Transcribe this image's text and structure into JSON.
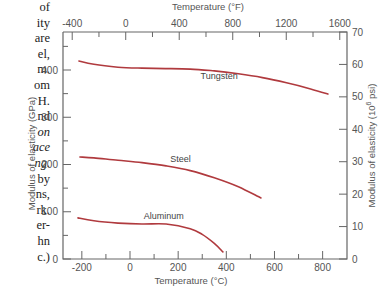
{
  "caption_fragments": [
    {
      "text": "of",
      "italic": false
    },
    {
      "text": "ity",
      "italic": false
    },
    {
      "text": "are",
      "italic": false
    },
    {
      "text": "el,",
      "italic": false
    },
    {
      "text": "m.",
      "italic": false
    },
    {
      "text": "om",
      "italic": false
    },
    {
      "text": "H.",
      "italic": false
    },
    {
      "text": "nd",
      "italic": false
    },
    {
      "text": "on",
      "italic": true
    },
    {
      "text": "ace",
      "italic": true
    },
    {
      "text": "ng.",
      "italic": true
    },
    {
      "text": "by",
      "italic": false
    },
    {
      "text": "ns,",
      "italic": false
    },
    {
      "text": "rk.",
      "italic": false
    },
    {
      "text": "er-",
      "italic": false
    },
    {
      "text": "hn",
      "italic": false
    },
    {
      "text": "c.)",
      "italic": false
    }
  ],
  "chart_data": {
    "type": "line",
    "title": "",
    "xlabel": "Temperature (°C)",
    "ylabel": "Modulus of elasticity (GPa)",
    "x2label": "Temperature (°F)",
    "y2label": "Modulus of elasticity (10^6 psi)",
    "xlim": [
      -270,
      910
    ],
    "ylim": [
      0,
      480
    ],
    "y2lim": [
      0,
      70
    ],
    "grid": false,
    "legend": "inline labels",
    "x_ticks": [
      -200,
      0,
      200,
      400,
      600,
      800
    ],
    "x_minor_ticks": [
      -100,
      100,
      300,
      500,
      700
    ],
    "y_ticks": [
      0,
      100,
      200,
      300,
      400
    ],
    "y_minor_ticks": [
      50,
      150,
      250,
      350,
      450
    ],
    "x2_ticks": [
      -400,
      0,
      400,
      800,
      1200,
      1600
    ],
    "x2_minor_ticks": [
      -200,
      200,
      600,
      1000,
      1400
    ],
    "y2_ticks": [
      0,
      10,
      20,
      30,
      40,
      50,
      60,
      70
    ],
    "series": [
      {
        "name": "Tungsten",
        "color": "#b03a3e",
        "x": [
          -212,
          -150,
          -50,
          50,
          150,
          250,
          350,
          450,
          550,
          650,
          750,
          822
        ],
        "y": [
          419,
          412,
          406,
          404,
          403,
          402,
          398,
          392,
          384,
          373,
          360,
          349
        ]
      },
      {
        "name": "Steel",
        "color": "#b03a3e",
        "x": [
          -208,
          -150,
          -50,
          50,
          150,
          250,
          350,
          450,
          544
        ],
        "y": [
          216,
          214,
          209,
          204,
          197,
          187,
          172,
          153,
          129
        ]
      },
      {
        "name": "Aluminum",
        "color": "#b03a3e",
        "x": [
          -216,
          -150,
          -50,
          50,
          150,
          250,
          300,
          350,
          386
        ],
        "y": [
          87,
          81,
          76,
          74,
          74,
          64,
          52,
          33,
          15
        ]
      }
    ],
    "annotations": [
      {
        "text": "Tungsten",
        "x": 370,
        "y": 380
      },
      {
        "text": "Steel",
        "x": 210,
        "y": 205
      },
      {
        "text": "Aluminum",
        "x": 140,
        "y": 84
      }
    ]
  }
}
